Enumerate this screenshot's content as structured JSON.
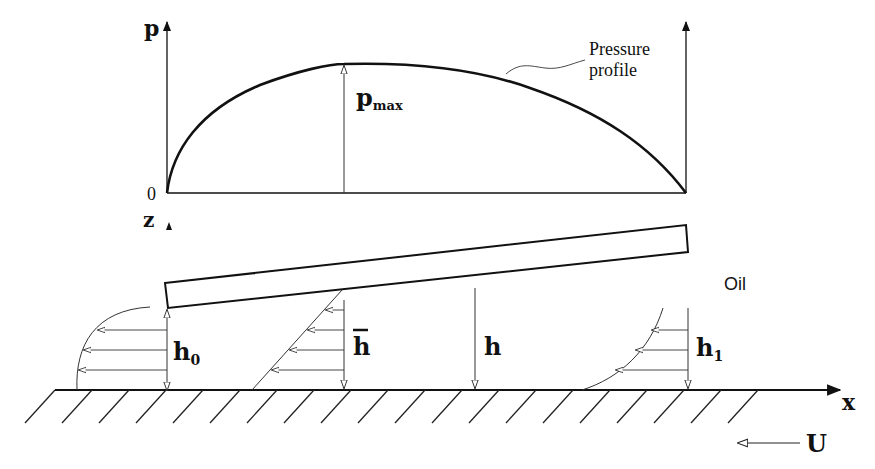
{
  "diagram": {
    "pressure_plot": {
      "y_axis_label": "p",
      "origin_label": "0",
      "peak_label_main": "p",
      "peak_label_sub": "max",
      "curve_annotation_line1": "Pressure",
      "curve_annotation_line2": "profile"
    },
    "bearing": {
      "z_axis_label": "z",
      "fluid_label": "Oil",
      "x_axis_label": "x",
      "velocity_label": "U",
      "gap_labels": [
        {
          "main": "h",
          "sub": "0",
          "overbar": false
        },
        {
          "main": "h",
          "sub": "",
          "overbar": true
        },
        {
          "main": "h",
          "sub": "",
          "overbar": false
        },
        {
          "main": "h",
          "sub": "1",
          "overbar": false
        }
      ]
    },
    "colors": {
      "ink": "#111111",
      "thin_line": "#333333",
      "background": "#ffffff"
    }
  }
}
